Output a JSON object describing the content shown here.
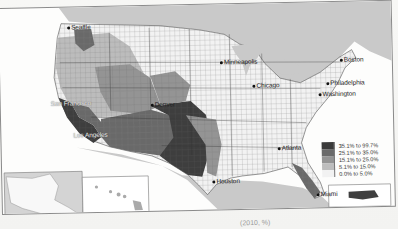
{
  "map": {
    "title": "",
    "type": "choropleth",
    "region": "United States counties",
    "colors": {
      "water": "#c9c9c9",
      "land_other": "#d4d4d4",
      "background": "#fdfdfc",
      "border": "#8a8a8a"
    },
    "cities": [
      {
        "name": "Seattle",
        "x": 68,
        "y": 20
      },
      {
        "name": "San Francisco",
        "x": 52,
        "y": 93
      },
      {
        "name": "Los Angeles",
        "x": 73,
        "y": 124
      },
      {
        "name": "Denver",
        "x": 152,
        "y": 96
      },
      {
        "name": "Minneapolis",
        "x": 222,
        "y": 55
      },
      {
        "name": "Chicago",
        "x": 253,
        "y": 79
      },
      {
        "name": "Boston",
        "x": 339,
        "y": 56
      },
      {
        "name": "Philadelphia",
        "x": 325,
        "y": 78
      },
      {
        "name": "Washington",
        "x": 317,
        "y": 89
      },
      {
        "name": "Atlanta",
        "x": 278,
        "y": 143
      },
      {
        "name": "Houston",
        "x": 212,
        "y": 174
      },
      {
        "name": "Miami",
        "x": 317,
        "y": 188
      }
    ],
    "insets": [
      "Alaska",
      "Hawaii",
      "Puerto Rico"
    ]
  },
  "legend": {
    "items": [
      {
        "label": "35.1% to 99.7%",
        "color": "#3a3a3a"
      },
      {
        "label": "25.1% to 35.0%",
        "color": "#6a6a6a"
      },
      {
        "label": "15.1% to 25.0%",
        "color": "#949494"
      },
      {
        "label": "5.1% to 15.0%",
        "color": "#bdbdbd"
      },
      {
        "label": "0.0% to 5.0%",
        "color": "#f2f2f2"
      }
    ]
  },
  "caption": {
    "text": "(2010, %)"
  }
}
